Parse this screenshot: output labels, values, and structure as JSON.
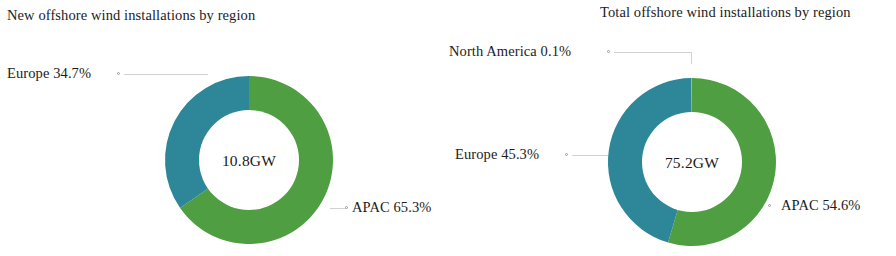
{
  "figure": {
    "background": "#ffffff",
    "colors": {
      "apac": "#4f9e42",
      "europe": "#2d8798",
      "north_america": "#7fb3c4",
      "leader_line": "#d2d2d2",
      "text": "#1c1c1c"
    }
  },
  "panels": [
    {
      "title": "New offshore wind installations by region",
      "center_label": "10.8GW",
      "labels": {
        "europe": "Europe 34.7%",
        "apac": "APAC 65.3%"
      }
    },
    {
      "title": "Total offshore wind installations by region",
      "center_label": "75.2GW",
      "labels": {
        "north_america": "North America 0.1%",
        "europe": "Europe 45.3%",
        "apac": "APAC 54.6%"
      }
    }
  ],
  "chart_data": [
    {
      "type": "pie",
      "title": "New offshore wind installations by region",
      "subtitle": "",
      "center_text": "10.8GW",
      "total": 10.8,
      "unit": "GW",
      "donut": true,
      "start_angle_deg": 0,
      "direction": "clockwise",
      "labels": [
        "APAC",
        "Europe"
      ],
      "values": [
        65.3,
        34.7
      ],
      "value_unit": "%",
      "annotations": [
        "APAC 65.3%",
        "Europe 34.7%"
      ],
      "legend": "none",
      "colors": [
        "#4f9e42",
        "#2d8798"
      ]
    },
    {
      "type": "pie",
      "title": "Total offshore wind installations by region",
      "subtitle": "",
      "center_text": "75.2GW",
      "total": 75.2,
      "unit": "GW",
      "donut": true,
      "start_angle_deg": 0,
      "direction": "clockwise",
      "labels": [
        "APAC",
        "Europe",
        "North America"
      ],
      "values": [
        54.6,
        45.3,
        0.1
      ],
      "value_unit": "%",
      "annotations": [
        "APAC 54.6%",
        "Europe 45.3%",
        "North America 0.1%"
      ],
      "legend": "none",
      "colors": [
        "#4f9e42",
        "#2d8798",
        "#7fb3c4"
      ]
    }
  ]
}
